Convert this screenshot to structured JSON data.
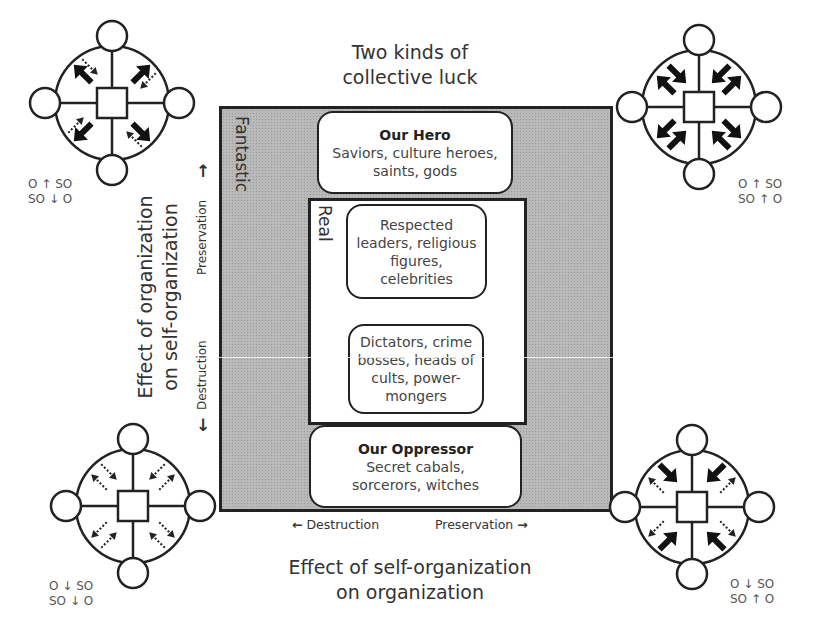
{
  "title": {
    "line1": "Two kinds of",
    "line2": "collective luck"
  },
  "regions": {
    "outer_label": "Fantastic",
    "inner_label": "Real"
  },
  "boxes": {
    "hero": {
      "heading": "Our Hero",
      "line1": "Saviors, culture heroes,",
      "line2": "saints, gods"
    },
    "respected": {
      "line1": "Respected",
      "line2": "leaders, religious",
      "line3": "figures,",
      "line4": "celebrities"
    },
    "dictators": {
      "line1": "Dictators, crime",
      "line2": "bosses, heads of",
      "line3": "cults, power-",
      "line4": "mongers"
    },
    "oppressor": {
      "heading": "Our Oppressor",
      "line1": "Secret cabals,",
      "line2": "sorcerors, witches"
    }
  },
  "y_axis": {
    "title_line1": "Effect of organization",
    "title_line2": "on self-organization",
    "tick_top": "Preservation",
    "tick_bottom": "Destruction",
    "arrow_up": "↑",
    "arrow_down": "↓"
  },
  "x_axis": {
    "title_line1": "Effect of self-organization",
    "title_line2": "on organization",
    "tick_left": "Destruction",
    "tick_right": "Preservation",
    "arrow_left": "←",
    "arrow_right": "→"
  },
  "corners": {
    "top_left": {
      "rel1": "O ↑ SO",
      "rel2": "SO ↓ O"
    },
    "top_right": {
      "rel1": "O ↑ SO",
      "rel2": "SO ↑ O"
    },
    "bottom_left": {
      "rel1": "O ↓ SO",
      "rel2": "SO ↓ O"
    },
    "bottom_right": {
      "rel1": "O ↓ SO",
      "rel2": "SO ↑ O"
    }
  },
  "colors": {
    "stroke": "#222222",
    "fill_gray": "#b9b9b9",
    "text": "#333333"
  }
}
